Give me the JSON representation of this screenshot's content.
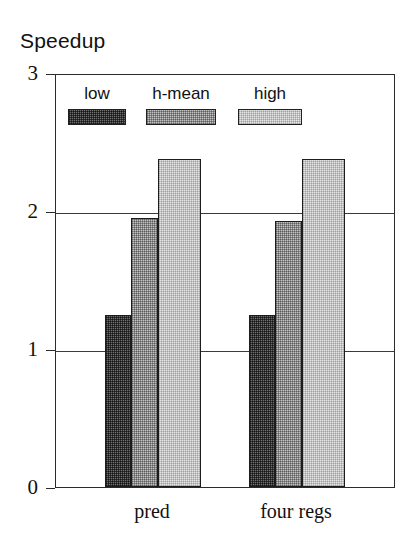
{
  "figure": {
    "title": "Speedup",
    "xlabel": "",
    "ylabel": "Speedup"
  },
  "legend": {
    "position": "inside-top-left",
    "entries": [
      {
        "label": "low",
        "swatch": "dark-dither-swatch",
        "color": "#6e6e6e"
      },
      {
        "label": "h-mean",
        "swatch": "medium-dither-swatch",
        "color": "#c3c3c3"
      },
      {
        "label": "high",
        "swatch": "light-dither-swatch",
        "color": "#e6e6e6"
      }
    ]
  },
  "axes": {
    "y_ticks": [
      "3",
      "2",
      "1",
      "0"
    ],
    "y_tick_values": [
      3,
      2,
      1,
      0
    ],
    "x_ticks": [
      "pred",
      "four regs"
    ]
  },
  "chart_data": {
    "type": "bar",
    "title": "Speedup",
    "xlabel": "",
    "ylabel": "Speedup",
    "ylim": [
      0,
      3
    ],
    "yticks": [
      0,
      1,
      2,
      3
    ],
    "grid": true,
    "legend_position": "inside-top-left",
    "categories": [
      "pred",
      "four regs"
    ],
    "series": [
      {
        "name": "low",
        "values": [
          1.25,
          1.25
        ],
        "color": "#6e6e6e"
      },
      {
        "name": "h-mean",
        "values": [
          1.95,
          1.93
        ],
        "color": "#c3c3c3"
      },
      {
        "name": "high",
        "values": [
          2.38,
          2.38
        ],
        "color": "#e6e6e6"
      }
    ]
  }
}
